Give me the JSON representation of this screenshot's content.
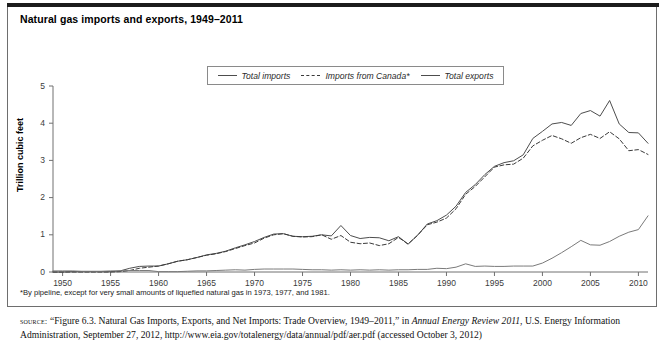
{
  "figure": {
    "title": "Natural gas imports and exports, 1949–2011",
    "footnote": "*By pipeline, except for very small amounts of liquefied natural gas in 1973, 1977, and 1981.",
    "source": {
      "label": "source:",
      "part1": " “Figure 6.3. Natural Gas Imports, Exports, and Net Imports: Trade Overview, 1949–2011,” in ",
      "italic_title": "Annual Energy Review 2011",
      "part2": ", U.S. Energy Information Administration, September 27, 2012, http://www.eia.gov/totalenergy/data/annual/pdf/aer.pdf (accessed October 3, 2012)"
    },
    "colors": {
      "total_imports": "#4d4d4d",
      "imports_from_canada": "#3a3a3a",
      "total_exports": "#7a7a7a",
      "axis": "#707070",
      "frame": "#6e6e6e",
      "top_rule": "#1c1c1c"
    }
  },
  "legend": {
    "position": "top-center-inside",
    "entries": [
      {
        "label": "Total imports",
        "style": "solid",
        "swatch": "solid-line-swatch"
      },
      {
        "label": "Imports from Canada*",
        "style": "dashed",
        "swatch": "dashed-line-swatch"
      },
      {
        "label": "Total exports",
        "style": "solid",
        "swatch": "solid-line-swatch"
      }
    ]
  },
  "chart_data": {
    "type": "line",
    "title": "Natural gas imports and exports, 1949–2011",
    "xlabel": "",
    "ylabel": "Trillion cubic feet",
    "xlim": [
      1949,
      2011
    ],
    "ylim": [
      0,
      5
    ],
    "grid": false,
    "yticks": [
      0,
      1,
      2,
      3,
      4,
      5
    ],
    "ytick_labels": [
      "0",
      "1",
      "2",
      "3",
      "4",
      "5"
    ],
    "xticks": [
      1950,
      1955,
      1960,
      1965,
      1970,
      1975,
      1980,
      1985,
      1990,
      1995,
      2000,
      2005,
      2010
    ],
    "xtick_labels": [
      "1950",
      "1955",
      "1960",
      "1965",
      "1970",
      "1975",
      "1980",
      "1985",
      "1990",
      "1995",
      "2000",
      "2005",
      "2010"
    ],
    "x": [
      1949,
      1950,
      1951,
      1952,
      1953,
      1954,
      1955,
      1956,
      1957,
      1958,
      1959,
      1960,
      1961,
      1962,
      1963,
      1964,
      1965,
      1966,
      1967,
      1968,
      1969,
      1970,
      1971,
      1972,
      1973,
      1974,
      1975,
      1976,
      1977,
      1978,
      1979,
      1980,
      1981,
      1982,
      1983,
      1984,
      1985,
      1986,
      1987,
      1988,
      1989,
      1990,
      1991,
      1992,
      1993,
      1994,
      1995,
      1996,
      1997,
      1998,
      1999,
      2000,
      2001,
      2002,
      2003,
      2004,
      2005,
      2006,
      2007,
      2008,
      2009,
      2010,
      2011
    ],
    "series": [
      {
        "name": "Total imports",
        "style": "solid",
        "color": "#4d4d4d",
        "values": [
          0.0,
          0.0,
          0.01,
          0.01,
          0.01,
          0.01,
          0.01,
          0.03,
          0.1,
          0.15,
          0.16,
          0.16,
          0.22,
          0.29,
          0.33,
          0.39,
          0.46,
          0.5,
          0.56,
          0.65,
          0.73,
          0.82,
          0.93,
          1.02,
          1.03,
          0.96,
          0.95,
          0.96,
          1.0,
          0.97,
          1.25,
          0.98,
          0.9,
          0.93,
          0.92,
          0.84,
          0.95,
          0.75,
          0.99,
          1.29,
          1.38,
          1.53,
          1.77,
          2.14,
          2.35,
          2.62,
          2.84,
          2.94,
          2.99,
          3.15,
          3.59,
          3.78,
          3.98,
          4.02,
          3.94,
          4.26,
          4.34,
          4.19,
          4.61,
          3.98,
          3.75,
          3.74,
          3.46
        ]
      },
      {
        "name": "Imports from Canada*",
        "style": "dashed",
        "color": "#3a3a3a",
        "values": [
          0.0,
          0.0,
          0.0,
          0.0,
          0.0,
          0.0,
          0.0,
          0.01,
          0.04,
          0.1,
          0.13,
          0.16,
          0.22,
          0.29,
          0.33,
          0.39,
          0.45,
          0.49,
          0.55,
          0.63,
          0.71,
          0.78,
          0.91,
          1.0,
          1.03,
          0.96,
          0.94,
          0.95,
          1.0,
          0.88,
          0.98,
          0.8,
          0.76,
          0.78,
          0.71,
          0.76,
          0.93,
          0.75,
          0.99,
          1.27,
          1.34,
          1.45,
          1.7,
          2.09,
          2.3,
          2.56,
          2.82,
          2.88,
          2.9,
          3.06,
          3.39,
          3.54,
          3.67,
          3.58,
          3.46,
          3.61,
          3.7,
          3.59,
          3.77,
          3.58,
          3.26,
          3.29,
          3.16
        ]
      },
      {
        "name": "Total exports",
        "style": "solid",
        "color": "#7a7a7a",
        "values": [
          0.03,
          0.03,
          0.03,
          0.02,
          0.02,
          0.02,
          0.03,
          0.03,
          0.04,
          0.04,
          0.04,
          0.01,
          0.01,
          0.01,
          0.02,
          0.03,
          0.03,
          0.04,
          0.05,
          0.06,
          0.05,
          0.07,
          0.08,
          0.08,
          0.08,
          0.08,
          0.07,
          0.06,
          0.06,
          0.05,
          0.06,
          0.05,
          0.06,
          0.05,
          0.06,
          0.05,
          0.06,
          0.06,
          0.07,
          0.07,
          0.1,
          0.09,
          0.13,
          0.22,
          0.15,
          0.16,
          0.15,
          0.15,
          0.16,
          0.16,
          0.16,
          0.24,
          0.37,
          0.52,
          0.68,
          0.85,
          0.73,
          0.72,
          0.82,
          0.96,
          1.07,
          1.14,
          1.51
        ]
      }
    ]
  },
  "axes": {
    "y_axis_title": "Trillion cubic feet"
  }
}
